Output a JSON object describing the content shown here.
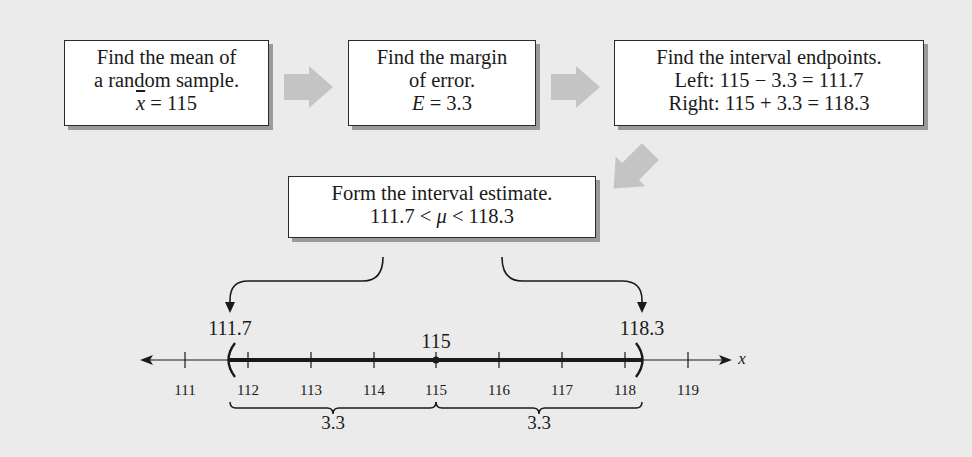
{
  "steps": {
    "mean": {
      "line1": "Find the mean of",
      "line2": "a random sample.",
      "symbol": "x",
      "equation": " = 115"
    },
    "margin": {
      "line1": "Find the margin",
      "line2": "of error.",
      "symbol": "E",
      "equation": " = 3.3"
    },
    "endpoints": {
      "line1": "Find the interval endpoints.",
      "line2": "Left: 115 − 3.3 = 111.7",
      "line3": "Right: 115 + 3.3 = 118.3"
    },
    "estimate": {
      "line1": "Form the interval estimate.",
      "lower": "111.7 < ",
      "symbol": "μ",
      "upper": " < 118.3"
    }
  },
  "number_line": {
    "left_endpoint_label": "111.7",
    "right_endpoint_label": "118.3",
    "center_label": "115",
    "axis_variable": "x",
    "ticks": [
      "111",
      "112",
      "113",
      "114",
      "115",
      "116",
      "117",
      "118",
      "119"
    ],
    "left_span_label": "3.3",
    "right_span_label": "3.3"
  },
  "colors": {
    "background": "#ebebeb",
    "box_fill": "#ffffff",
    "box_shadow": "#9a9a9a",
    "arrow_fill": "#c4c4c4",
    "ink": "#1a1a1a"
  }
}
